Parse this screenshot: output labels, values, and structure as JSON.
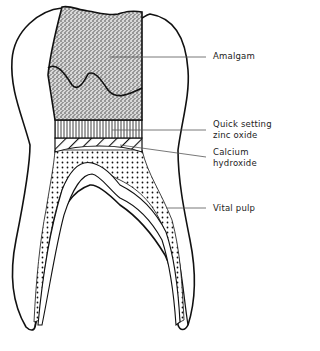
{
  "diagram": {
    "labels": {
      "amalgam": "Amalgam",
      "zinc_oxide_line1": "Quick setting",
      "zinc_oxide_line2": "zinc oxide",
      "calcium_line1": "Calcium",
      "calcium_line2": "hydroxide",
      "vital_pulp": "Vital pulp"
    },
    "layers_top_to_bottom": [
      "Amalgam",
      "Quick setting zinc oxide",
      "Calcium hydroxide",
      "Vital pulp"
    ],
    "colors": {
      "stroke": "#111111",
      "leader": "#555555",
      "background": "#ffffff"
    }
  }
}
